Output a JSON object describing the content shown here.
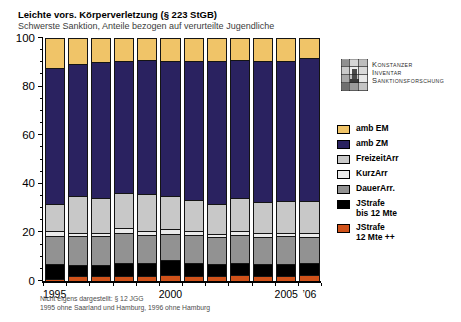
{
  "header": {
    "title": "Leichte vors. Körperverletzung (§ 223 StGB)",
    "subtitle": "Schwerste Sanktion, Anteile bezogen auf verurteilte Jugendliche"
  },
  "logo": {
    "lines": [
      "Konstanzer",
      "Inventar",
      "Sanktionsforschung"
    ]
  },
  "legend": {
    "items": [
      {
        "name": "amb EM",
        "color": "#f0c468",
        "lines": [
          "amb EM"
        ]
      },
      {
        "name": "amb ZM",
        "color": "#2a2260",
        "lines": [
          "amb ZM"
        ]
      },
      {
        "name": "FreizeitArr",
        "color": "#c8c8c8",
        "lines": [
          "FreizeitArr"
        ]
      },
      {
        "name": "KurzArr",
        "color": "#ebebeb",
        "lines": [
          "KurzArr"
        ]
      },
      {
        "name": "DauerArr.",
        "color": "#929292",
        "lines": [
          "DauerArr."
        ]
      },
      {
        "name": "JStrafe bis 12 Mte",
        "color": "#000000",
        "lines": [
          "JStrafe",
          "bis 12 Mte"
        ]
      },
      {
        "name": "JStrafe 12 Mte ++",
        "color": "#d0521a",
        "lines": [
          "JStrafe",
          "12 Mte ++"
        ]
      }
    ]
  },
  "chart_data": {
    "type": "bar",
    "stacked": true,
    "unit": "percent of convicted juveniles",
    "title": "Leichte vors. Körperverletzung (§ 223 StGB)",
    "subtitle": "Schwerste Sanktion, Anteile bezogen auf verurteilte Jugendliche",
    "categories": [
      1995,
      1996,
      1997,
      1998,
      1999,
      2000,
      2001,
      2002,
      2003,
      2004,
      2005,
      2006
    ],
    "x_tick_labels": [
      "1995",
      "",
      "",
      "",
      "",
      "2000",
      "",
      "",
      "",
      "",
      "2005",
      "’06"
    ],
    "ylim": [
      0,
      100
    ],
    "y_major_ticks": [
      0,
      20,
      40,
      60,
      80,
      100
    ],
    "y_minor_step": 5,
    "grid": false,
    "legend_position": "right",
    "series_bottom_to_top": [
      {
        "name": "JStrafe 12 Mte ++",
        "color": "#d0521a",
        "values": [
          1,
          2,
          2,
          2,
          2,
          2.5,
          2,
          2,
          2.5,
          2,
          2,
          2.5
        ]
      },
      {
        "name": "JStrafe bis 12 Mte",
        "color": "#000000",
        "values": [
          6,
          4.5,
          4.5,
          5.5,
          5.5,
          6,
          5.5,
          5,
          5,
          5,
          5,
          5
        ]
      },
      {
        "name": "DauerArr.",
        "color": "#929292",
        "values": [
          11.5,
          12,
          12,
          12.5,
          11.5,
          11,
          11.5,
          11,
          11.5,
          11,
          11.5,
          10.5
        ]
      },
      {
        "name": "KurzArr",
        "color": "#ebebeb",
        "values": [
          2,
          1.5,
          1.5,
          2,
          1.5,
          2,
          1.5,
          1.5,
          1.5,
          2,
          1.5,
          2
        ]
      },
      {
        "name": "FreizeitArr",
        "color": "#c8c8c8",
        "values": [
          11.5,
          15,
          14.5,
          14.5,
          15.5,
          13.5,
          13,
          12.5,
          14,
          12.5,
          13,
          13
        ]
      },
      {
        "name": "amb ZM",
        "color": "#2a2260",
        "values": [
          56,
          54.5,
          56,
          54.5,
          55.5,
          56,
          57.5,
          59,
          57,
          58.5,
          58,
          59
        ]
      },
      {
        "name": "amb EM",
        "color": "#f0c468",
        "values": [
          12,
          10.5,
          9.5,
          9,
          8.5,
          9,
          9,
          9,
          8.5,
          9,
          9,
          8
        ]
      }
    ]
  },
  "footnote": {
    "line1": "Nicht eigens dargestellt: § 12 JGG",
    "line2": "1995 ohne Saarland und Hamburg, 1996 ohne Hamburg"
  }
}
